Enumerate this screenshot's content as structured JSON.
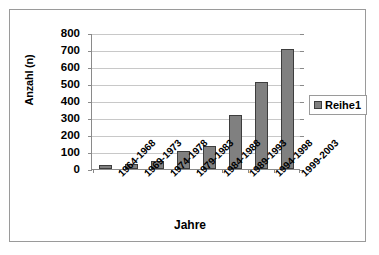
{
  "chart_data": {
    "type": "bar",
    "title": "",
    "xlabel": "Jahre",
    "ylabel": "Anzahl (n)",
    "categories": [
      "1964-1968",
      "1969-1973",
      "1974-1978",
      "1979-1983",
      "1984-1988",
      "1989-1993",
      "1994-1998",
      "1999-2003"
    ],
    "values": [
      25,
      28,
      48,
      105,
      135,
      315,
      510,
      705
    ],
    "series": [
      {
        "name": "Reihe1",
        "values": [
          25,
          28,
          48,
          105,
          135,
          315,
          510,
          705
        ]
      }
    ],
    "ylim": [
      0,
      800
    ],
    "ytick_step": 100,
    "yticks": [
      "800",
      "700",
      "600",
      "500",
      "400",
      "300",
      "200",
      "100",
      "0"
    ],
    "grid": true,
    "legend_position": "right",
    "bar_color": "#808080",
    "bar_border_color": "#3d3d3d",
    "gridline_color": "#c8c8c8",
    "axis_color": "#8a8a8a",
    "frame_color": "#9a9a9a",
    "plot_background": "#ffffff"
  },
  "legend": {
    "entries": [
      {
        "label": "Reihe1"
      }
    ]
  }
}
